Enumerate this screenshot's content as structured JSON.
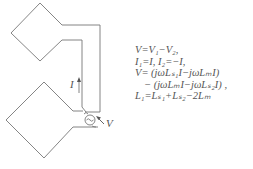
{
  "diagram": {
    "current_label": "I",
    "voltage_label": "V",
    "source_icon": "ac-source-icon",
    "line_color": "#777777"
  },
  "equations": [
    "V=V₁−V₂,",
    "I₁=I,  I₂=−I,",
    "V=  (jωLₛ₁I−jωLₘI)",
    "−  (jωLₘI−jωLₛ₂I)  ,",
    "L₁=Lₛ₁+Lₛ₂−2Lₘ"
  ]
}
